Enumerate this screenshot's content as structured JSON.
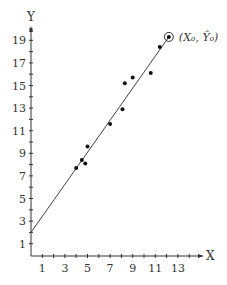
{
  "chart_data": {
    "type": "scatter",
    "title": "",
    "xlabel": "X",
    "ylabel": "Y",
    "xlim": [
      0,
      14
    ],
    "ylim": [
      0,
      20
    ],
    "x_ticks": [
      1,
      3,
      5,
      7,
      9,
      11,
      13
    ],
    "y_ticks": [
      1,
      3,
      5,
      7,
      9,
      11,
      13,
      15,
      17,
      19
    ],
    "grid": false,
    "legend": null,
    "points": [
      {
        "x": 4.0,
        "y": 7.7
      },
      {
        "x": 4.5,
        "y": 8.4
      },
      {
        "x": 4.8,
        "y": 8.1
      },
      {
        "x": 5.0,
        "y": 9.6
      },
      {
        "x": 7.0,
        "y": 11.6
      },
      {
        "x": 8.1,
        "y": 12.9
      },
      {
        "x": 8.3,
        "y": 15.2
      },
      {
        "x": 9.0,
        "y": 15.7
      },
      {
        "x": 10.6,
        "y": 16.1
      },
      {
        "x": 11.4,
        "y": 18.4
      }
    ],
    "regression_line": {
      "x0": 0,
      "y0": 2.0,
      "x1": 12.2,
      "y1": 19.3
    },
    "highlighted_point": {
      "x": 12.2,
      "y": 19.3,
      "label": "(X₀, Ŷ₀)"
    },
    "annotations": [
      "(X₀, Ŷ₀)"
    ]
  }
}
